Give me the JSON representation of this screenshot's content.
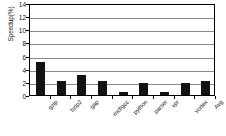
{
  "chart_data": {
    "type": "bar",
    "title": "",
    "subtitle": "",
    "xlabel": "",
    "ylabel": "Speedup(%)",
    "categories": [
      "gzip",
      "bzip2",
      "gap",
      "mcf/gcc",
      "python",
      "parser",
      "vpr",
      "vortex",
      "Avg"
    ],
    "values": [
      5.0,
      2.15,
      3.05,
      2.2,
      0.45,
      1.9,
      0.45,
      1.9,
      2.1
    ],
    "ylim": [
      0,
      14
    ],
    "yticks": [
      0,
      2,
      4,
      6,
      8,
      10,
      12,
      14
    ],
    "ytick_labels": [
      "0",
      "2",
      "4",
      "6",
      "8",
      "10",
      "12",
      "14"
    ],
    "grid": true,
    "grid_axis": "y",
    "legend": false,
    "legend_position": "none",
    "bar_color": "#131313",
    "grid_color": "#8a8a8a",
    "axis_color": "#000000",
    "plot_background": "#ffffff",
    "label_rotation": -45
  }
}
